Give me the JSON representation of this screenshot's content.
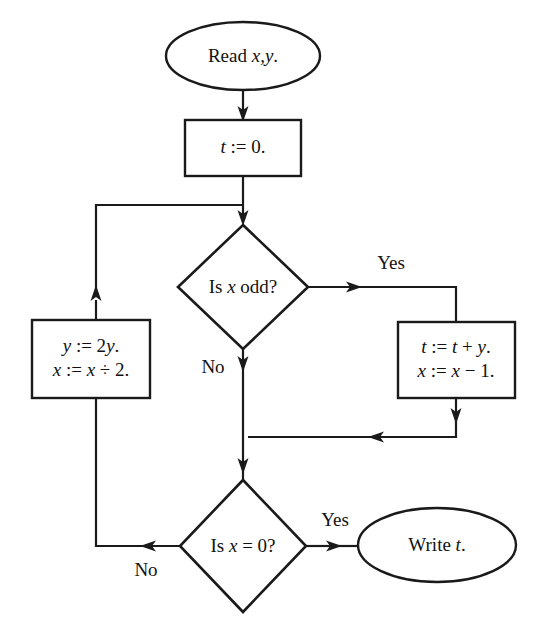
{
  "diagram": {
    "type": "flowchart",
    "background_color": "#ffffff",
    "line_color": "#1a1a1a",
    "text_color": "#111111"
  },
  "nodes": {
    "start": {
      "id": "start",
      "shape": "ellipse",
      "label": "Read x,y.",
      "text_prefix": "Read ",
      "text_var": "x,y",
      "text_suffix": "."
    },
    "init": {
      "id": "init",
      "shape": "rectangle",
      "label": "t := 0.",
      "line1_var": "t",
      "line1_rest": " := 0."
    },
    "decision_odd": {
      "id": "decision-is-x-odd",
      "shape": "diamond",
      "label": "Is x odd?",
      "text_prefix": "Is ",
      "text_var": "x",
      "text_suffix": " odd?"
    },
    "halve": {
      "id": "process-halve",
      "shape": "rectangle",
      "label": "y := 2y.  x := x ÷ 2.",
      "line1_var": "y",
      "line1_rest": " := 2",
      "line1_var2": "y",
      "line1_end": ".",
      "line2_var": "x",
      "line2_rest": " := ",
      "line2_var2": "x",
      "line2_end": " ÷ 2."
    },
    "accumulate": {
      "id": "process-accumulate",
      "shape": "rectangle",
      "label": "t := t + y.  x := x − 1.",
      "line1_var": "t",
      "line1_rest": " := ",
      "line1_var2": "t",
      "line1_mid": " + ",
      "line1_var3": "y",
      "line1_end": ".",
      "line2_var": "x",
      "line2_rest": " := ",
      "line2_var2": "x",
      "line2_end": " − 1."
    },
    "decision_zero": {
      "id": "decision-is-x-zero",
      "shape": "diamond",
      "label": "Is x = 0?",
      "text_prefix": "Is ",
      "text_var": "x",
      "text_suffix": " = 0?"
    },
    "end": {
      "id": "end-write",
      "shape": "ellipse",
      "label": "Write t.",
      "text_prefix": "Write ",
      "text_var": "t",
      "text_suffix": "."
    }
  },
  "edge_labels": {
    "odd_yes": "Yes",
    "odd_no": "No",
    "zero_yes": "Yes",
    "zero_no": "No"
  },
  "edges": [
    {
      "from": "start",
      "to": "init",
      "label": ""
    },
    {
      "from": "init",
      "to": "decision_odd",
      "label": ""
    },
    {
      "from": "decision_odd",
      "to": "accumulate",
      "label": "Yes"
    },
    {
      "from": "decision_odd",
      "to": "merge",
      "label": "No"
    },
    {
      "from": "accumulate",
      "to": "merge",
      "label": ""
    },
    {
      "from": "merge",
      "to": "decision_zero",
      "label": ""
    },
    {
      "from": "decision_zero",
      "to": "end",
      "label": "Yes"
    },
    {
      "from": "decision_zero",
      "to": "halve",
      "label": "No"
    },
    {
      "from": "halve",
      "to": "decision_odd",
      "label": ""
    }
  ]
}
